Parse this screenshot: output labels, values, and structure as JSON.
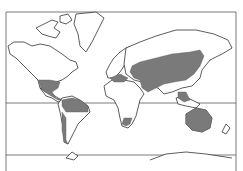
{
  "map": {
    "type": "world-distribution-map",
    "projection": "mercator-like",
    "colors": {
      "background": "#ffffff",
      "land_outline": "#333333",
      "distribution_fill": "#7a7a7a"
    },
    "lines": [
      "equator",
      "southern-boundary"
    ],
    "distribution_regions": [
      "southern-north-america-central-america",
      "northern-south-america",
      "southern-africa-tip",
      "mediterranean-middle-east",
      "central-asia-russia-china",
      "southeast-asia-indonesia",
      "australia"
    ]
  }
}
